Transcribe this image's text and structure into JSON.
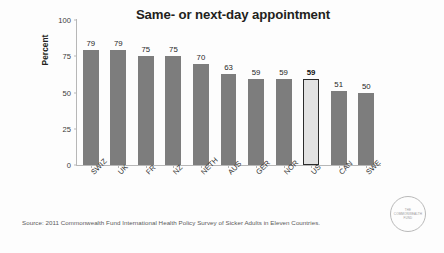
{
  "chart_data": {
    "type": "bar",
    "title": "Same- or next-day appointment",
    "xlabel": "",
    "ylabel": "Percent",
    "categories": [
      "SWIZ",
      "UK",
      "FR",
      "NZ",
      "NETH",
      "AUS",
      "GER",
      "NOR",
      "US",
      "CAN",
      "SWE"
    ],
    "values": [
      79,
      79,
      75,
      75,
      70,
      63,
      59,
      59,
      59,
      51,
      50
    ],
    "value_labels": [
      "79",
      "79",
      "75",
      "75",
      "70",
      "63",
      "59",
      "59",
      "59",
      "51",
      "50"
    ],
    "highlight_index": 8,
    "highlight_category": "US",
    "ylim": [
      0,
      100
    ],
    "yticks": [
      0,
      25,
      50,
      75,
      100
    ],
    "ytick_labels": [
      "0",
      "25",
      "50",
      "75",
      "100"
    ],
    "grid": false,
    "legend": false,
    "bar_color": "#7d7d7d",
    "highlight_fill": "#e2e2e2",
    "highlight_border": "#2b2b2b",
    "axis_color": "#b7b7b7",
    "text_color": "#231f20"
  },
  "source": {
    "text": "Source: 2011 Commonwealth Fund International Health Policy Survey of Sicker Adults in Eleven Countries."
  },
  "logo": {
    "line1": "THE",
    "line2": "COMMONWEALTH",
    "line3": "FUND"
  }
}
